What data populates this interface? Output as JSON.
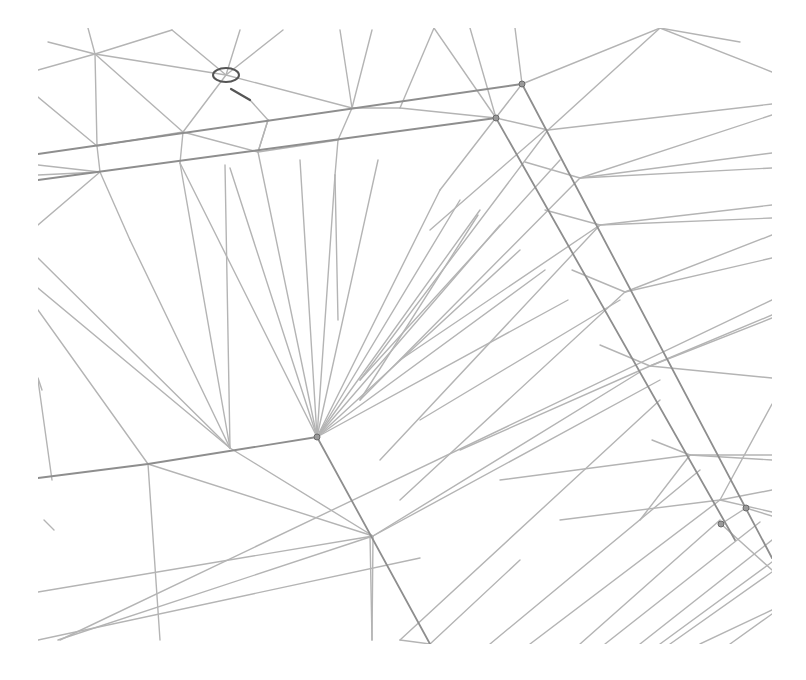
{
  "diagram": {
    "type": "triangulated-mesh-wireframe",
    "canvas": {
      "width": 806,
      "height": 680,
      "clip": {
        "x0": 38,
        "y0": 28,
        "x1": 772,
        "y1": 644
      }
    },
    "colors": {
      "background": "#ffffff",
      "edge": "#b4b4b4",
      "edge_bold": "#8e8e8e",
      "node": "#9a9a9a",
      "marker": "#555555"
    },
    "nodes": [
      {
        "id": "fan-center",
        "x": 317,
        "y": 437
      },
      {
        "id": "top-node-a",
        "x": 522,
        "y": 84
      },
      {
        "id": "top-node-b",
        "x": 496,
        "y": 118
      },
      {
        "id": "right-node-a",
        "x": 746,
        "y": 508
      },
      {
        "id": "right-node-b",
        "x": 721,
        "y": 524
      }
    ],
    "marker": {
      "type": "ellipse",
      "cx": 226,
      "cy": 75,
      "rx": 13,
      "ry": 7,
      "tick": {
        "x1": 231,
        "y1": 89,
        "x2": 250,
        "y2": 100
      }
    },
    "bold_edges": [
      [
        38,
        154,
        522,
        84
      ],
      [
        38,
        180,
        496,
        118
      ],
      [
        522,
        84,
        772,
        558
      ],
      [
        496,
        118,
        735,
        540
      ],
      [
        38,
        478,
        148,
        464
      ],
      [
        148,
        464,
        317,
        437
      ],
      [
        317,
        437,
        430,
        644
      ]
    ],
    "edges": [
      [
        48,
        42,
        95,
        54
      ],
      [
        95,
        54,
        172,
        30
      ],
      [
        95,
        54,
        38,
        70
      ],
      [
        88,
        28,
        95,
        54
      ],
      [
        95,
        54,
        226,
        75
      ],
      [
        172,
        30,
        226,
        75
      ],
      [
        240,
        30,
        226,
        75
      ],
      [
        283,
        30,
        226,
        75
      ],
      [
        226,
        75,
        352,
        108
      ],
      [
        95,
        54,
        183,
        132
      ],
      [
        95,
        54,
        97,
        146
      ],
      [
        97,
        146,
        38,
        97
      ],
      [
        97,
        146,
        183,
        132
      ],
      [
        97,
        146,
        100,
        172
      ],
      [
        38,
        165,
        100,
        172
      ],
      [
        100,
        172,
        38,
        225
      ],
      [
        100,
        172,
        130,
        240
      ],
      [
        38,
        175,
        100,
        172
      ],
      [
        226,
        75,
        183,
        132
      ],
      [
        183,
        132,
        180,
        163
      ],
      [
        183,
        132,
        258,
        152
      ],
      [
        250,
        100,
        268,
        120
      ],
      [
        268,
        120,
        258,
        152
      ],
      [
        258,
        152,
        268,
        120
      ],
      [
        352,
        108,
        338,
        140
      ],
      [
        338,
        140,
        258,
        152
      ],
      [
        338,
        140,
        335,
        175
      ],
      [
        340,
        30,
        352,
        108
      ],
      [
        372,
        30,
        352,
        108
      ],
      [
        352,
        108,
        400,
        108
      ],
      [
        400,
        108,
        434,
        28
      ],
      [
        434,
        28,
        496,
        118
      ],
      [
        470,
        28,
        496,
        118
      ],
      [
        515,
        28,
        522,
        84
      ],
      [
        522,
        84,
        660,
        28
      ],
      [
        660,
        28,
        740,
        42
      ],
      [
        660,
        28,
        772,
        72
      ],
      [
        660,
        28,
        548,
        130
      ],
      [
        400,
        108,
        496,
        118
      ],
      [
        548,
        130,
        772,
        104
      ],
      [
        548,
        130,
        496,
        118
      ],
      [
        548,
        130,
        360,
        380
      ],
      [
        522,
        84,
        440,
        190
      ],
      [
        580,
        178,
        772,
        115
      ],
      [
        580,
        178,
        772,
        153
      ],
      [
        580,
        178,
        525,
        162
      ],
      [
        580,
        178,
        772,
        168
      ],
      [
        580,
        178,
        360,
        400
      ],
      [
        600,
        225,
        772,
        205
      ],
      [
        600,
        225,
        772,
        218
      ],
      [
        600,
        225,
        545,
        210
      ],
      [
        600,
        225,
        380,
        460
      ],
      [
        625,
        292,
        772,
        235
      ],
      [
        625,
        292,
        772,
        258
      ],
      [
        625,
        292,
        572,
        270
      ],
      [
        625,
        292,
        400,
        500
      ],
      [
        650,
        366,
        772,
        315
      ],
      [
        650,
        366,
        772,
        318
      ],
      [
        650,
        366,
        600,
        345
      ],
      [
        650,
        366,
        772,
        378
      ],
      [
        690,
        455,
        772,
        455
      ],
      [
        690,
        455,
        772,
        460
      ],
      [
        690,
        455,
        652,
        440
      ],
      [
        690,
        455,
        640,
        520
      ],
      [
        720,
        500,
        772,
        490
      ],
      [
        720,
        500,
        772,
        512
      ],
      [
        720,
        500,
        772,
        404
      ],
      [
        317,
        437,
        180,
        163
      ],
      [
        317,
        437,
        230,
        168
      ],
      [
        317,
        437,
        258,
        152
      ],
      [
        317,
        437,
        300,
        160
      ],
      [
        317,
        437,
        335,
        175
      ],
      [
        317,
        437,
        378,
        160
      ],
      [
        317,
        437,
        440,
        190
      ],
      [
        317,
        437,
        460,
        200
      ],
      [
        317,
        437,
        480,
        210
      ],
      [
        317,
        437,
        500,
        225
      ],
      [
        317,
        437,
        520,
        250
      ],
      [
        317,
        437,
        545,
        270
      ],
      [
        317,
        437,
        568,
        300
      ],
      [
        230,
        448,
        130,
        240
      ],
      [
        230,
        448,
        38,
        258
      ],
      [
        230,
        448,
        38,
        288
      ],
      [
        230,
        448,
        180,
        163
      ],
      [
        230,
        448,
        225,
        165
      ],
      [
        148,
        464,
        38,
        310
      ],
      [
        148,
        464,
        160,
        640
      ],
      [
        148,
        464,
        373,
        536
      ],
      [
        230,
        448,
        373,
        536
      ],
      [
        42,
        390,
        38,
        378
      ],
      [
        38,
        380,
        52,
        480
      ],
      [
        44,
        520,
        54,
        530
      ],
      [
        373,
        536,
        38,
        592
      ],
      [
        373,
        536,
        58,
        640
      ],
      [
        373,
        536,
        640,
        372
      ],
      [
        373,
        536,
        660,
        380
      ],
      [
        430,
        644,
        520,
        560
      ],
      [
        430,
        644,
        400,
        640
      ],
      [
        400,
        640,
        660,
        400
      ],
      [
        490,
        644,
        700,
        470
      ],
      [
        530,
        644,
        720,
        500
      ],
      [
        580,
        644,
        720,
        520
      ],
      [
        605,
        644,
        760,
        522
      ],
      [
        640,
        644,
        772,
        540
      ],
      [
        670,
        644,
        772,
        572
      ],
      [
        700,
        644,
        772,
        610
      ],
      [
        730,
        644,
        772,
        614
      ],
      [
        660,
        644,
        772,
        562
      ],
      [
        38,
        640,
        420,
        558
      ],
      [
        60,
        640,
        772,
        300
      ],
      [
        335,
        175,
        338,
        320
      ],
      [
        360,
        400,
        478,
        215
      ],
      [
        430,
        230,
        545,
        130
      ],
      [
        360,
        380,
        560,
        160
      ],
      [
        400,
        360,
        600,
        225
      ],
      [
        420,
        420,
        620,
        300
      ],
      [
        460,
        450,
        650,
        366
      ],
      [
        500,
        480,
        690,
        455
      ],
      [
        560,
        520,
        720,
        500
      ],
      [
        372,
        640,
        370,
        535
      ],
      [
        372,
        640,
        373,
        536
      ],
      [
        721,
        524,
        772,
        570
      ],
      [
        746,
        508,
        772,
        516
      ],
      [
        746,
        508,
        721,
        524
      ]
    ]
  }
}
